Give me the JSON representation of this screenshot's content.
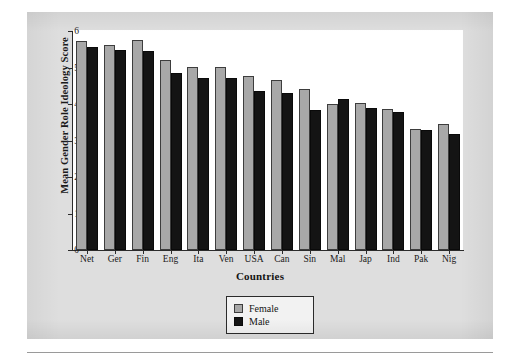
{
  "chart_data": {
    "type": "bar",
    "title": "",
    "xlabel": "Countries",
    "ylabel": "Mean Gender Role Ideology Score",
    "ylim": [
      0,
      6
    ],
    "yticks": [
      0,
      1,
      2,
      3,
      4,
      5,
      6
    ],
    "grid": false,
    "legend_position": "bottom-center",
    "categories": [
      "Net",
      "Ger",
      "Fin",
      "Eng",
      "Ita",
      "Ven",
      "USA",
      "Can",
      "Sin",
      "Mal",
      "Jap",
      "Ind",
      "Pak",
      "Nig"
    ],
    "series": [
      {
        "name": "Female",
        "color": "#a8a8a8",
        "values": [
          5.73,
          5.63,
          5.75,
          5.2,
          5.01,
          5.01,
          4.78,
          4.66,
          4.42,
          3.99,
          4.02,
          3.85,
          3.31,
          3.44
        ]
      },
      {
        "name": "Male",
        "color": "#141414",
        "values": [
          5.57,
          5.47,
          5.46,
          4.85,
          4.72,
          4.72,
          4.35,
          4.31,
          3.83,
          4.14,
          3.88,
          3.79,
          3.29,
          3.18
        ]
      }
    ]
  },
  "axes": {
    "y_title": "Mean Gender Role Ideology Score",
    "x_title": "Countries",
    "y_tick_labels": [
      "6",
      "5",
      "4",
      "3",
      "2",
      "1",
      "0"
    ]
  },
  "legend": {
    "entries": [
      {
        "label": "Female",
        "swatch": "female-swatch"
      },
      {
        "label": "Male",
        "swatch": "male-swatch"
      }
    ]
  }
}
